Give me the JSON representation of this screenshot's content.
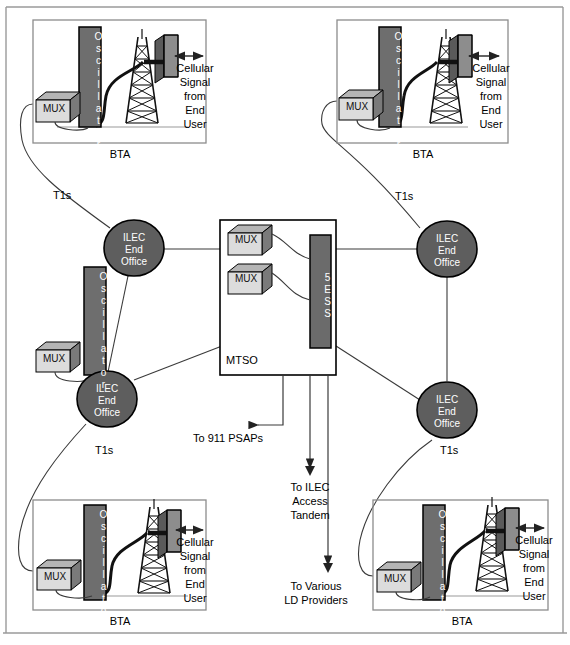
{
  "diagram": {
    "colors": {
      "oscillator_fill": "#6e6e6e",
      "oscillator_stroke": "#000000",
      "ellipse_fill": "#5e5e5e",
      "switch_fill": "#6b6b6b",
      "mux_front": "#d8d8d8",
      "mux_side": "#7a7a7a",
      "mux_top": "#b5b5b5",
      "antenna_front": "#8a8a8a",
      "antenna_side": "#5a5a5a",
      "box_border": "#8c8c8c",
      "line": "#3a3a3a",
      "frame": "#9a9a9a",
      "text": "#000000",
      "oscillator_text": "#ffffff",
      "switch_text": "#ffffff",
      "ellipse_text": "#ffffff"
    },
    "outer_frame": {
      "present": true
    },
    "bta_sites": [
      {
        "id": "bta-top-left",
        "caption": "BTA",
        "oscillator_label": "Oscillator",
        "mux_label": "MUX",
        "signal_label": "Cellular\nSignal\nfrom\nEnd\nUser",
        "signal_lines": [
          "Cellular",
          "Signal",
          "from",
          "End",
          "User"
        ]
      },
      {
        "id": "bta-top-right",
        "caption": "BTA",
        "oscillator_label": "Oscillator",
        "mux_label": "MUX",
        "signal_lines": [
          "Cellular",
          "Signal",
          "from",
          "End",
          "User"
        ]
      },
      {
        "id": "bta-bottom-left",
        "caption": "BTA",
        "oscillator_label": "Oscillator",
        "mux_label": "MUX",
        "signal_lines": [
          "Cellular",
          "Signal",
          "from",
          "End",
          "User"
        ]
      },
      {
        "id": "bta-bottom-right",
        "caption": "BTA",
        "oscillator_label": "Oscillator",
        "mux_label": "MUX",
        "signal_lines": [
          "Cellular",
          "Signal",
          "from",
          "End",
          "User"
        ]
      }
    ],
    "end_offices": [
      {
        "id": "ileo-upper-left",
        "lines": [
          "ILEC",
          "End",
          "Office"
        ]
      },
      {
        "id": "ileo-upper-right",
        "lines": [
          "ILEC",
          "End",
          "Office"
        ]
      },
      {
        "id": "ileo-lower-left",
        "lines": [
          "ILEC",
          "End",
          "Office"
        ]
      },
      {
        "id": "ileo-lower-right",
        "lines": [
          "ILEC",
          "End",
          "Office"
        ]
      }
    ],
    "standalone_oscillator": {
      "id": "oscillator-mid-left",
      "oscillator_label": "Oscillator",
      "mux_label": "MUX"
    },
    "mtso": {
      "caption": "MTSO",
      "switch_label": "5ESS",
      "mux_labels": [
        "MUX",
        "MUX"
      ]
    },
    "trunk_labels": [
      {
        "id": "t1s-top-left",
        "text": "T1s"
      },
      {
        "id": "t1s-top-right",
        "text": "T1s"
      },
      {
        "id": "t1s-bottom-left",
        "text": "T1s"
      },
      {
        "id": "t1s-bottom-right",
        "text": "T1s"
      }
    ],
    "destinations": [
      {
        "id": "dest-911",
        "lines": [
          "To 911 PSAPs"
        ],
        "arrow": "left"
      },
      {
        "id": "dest-tandem",
        "lines": [
          "To ILEC",
          "Access",
          "Tandem"
        ],
        "arrow": "down"
      },
      {
        "id": "dest-ld",
        "lines": [
          "To Various",
          "LD Providers"
        ],
        "arrow": "down"
      }
    ]
  }
}
